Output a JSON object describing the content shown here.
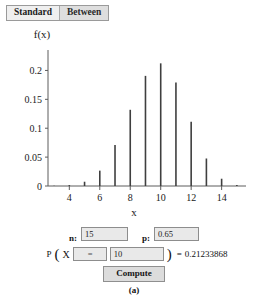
{
  "tabs": [
    {
      "label": "Standard",
      "selected": true
    },
    {
      "label": "Between",
      "selected": false
    }
  ],
  "chart_data": {
    "type": "bar",
    "title": "",
    "xlabel": "x",
    "ylabel": "f(x)",
    "xticklabels": [
      "4",
      "6",
      "8",
      "10",
      "12",
      "14"
    ],
    "xtickvalues": [
      4,
      6,
      8,
      10,
      12,
      14
    ],
    "yticklabels": [
      "0",
      "0.05",
      "0.1",
      "0.15",
      "0.2"
    ],
    "ytickvalues": [
      0,
      0.05,
      0.1,
      0.15,
      0.2
    ],
    "xlim": [
      2.6,
      15.6
    ],
    "ylim": [
      0,
      0.225
    ],
    "grid": false,
    "legend": null,
    "categories": [
      3,
      4,
      5,
      6,
      7,
      8,
      9,
      10,
      11,
      12,
      13,
      14,
      15
    ],
    "values": [
      0.0004,
      0.0016,
      0.0074,
      0.0266,
      0.071,
      0.1319,
      0.1906,
      0.2123,
      0.1792,
      0.111,
      0.0476,
      0.0126,
      0.0016
    ]
  },
  "form": {
    "n_label": "n:",
    "n_value": "15",
    "p_label": "p:",
    "p_value": "0.65",
    "p_prefix": "P",
    "open_paren": "(",
    "variable": "X",
    "operator": "=",
    "k_value": "10",
    "close_paren": ")",
    "equals": "=",
    "result": "0.21233868",
    "compute_label": "Compute"
  },
  "caption": "(a)",
  "colors": {
    "bar": "#3f3f3f",
    "axis": "#5d5d5d",
    "tab_selected_bg": "#efefef",
    "tab_unselected_bg": "#dedede",
    "field_bg": "#e9e9e9",
    "button_bg": "#dcdcdc"
  }
}
